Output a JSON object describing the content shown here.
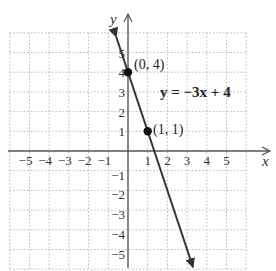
{
  "chart_data": {
    "type": "line",
    "title": "",
    "equation": "y = −3x + 4",
    "xlabel": "x",
    "ylabel": "y",
    "xlim": [
      -6,
      6
    ],
    "ylim": [
      -6,
      6
    ],
    "grid": true,
    "grid_style": "dotted",
    "x_tick_labels": [
      "−5",
      "−4",
      "−3",
      "−2",
      "−1",
      "1",
      "2",
      "3",
      "4",
      "5"
    ],
    "y_tick_labels": [
      "5",
      "4",
      "3",
      "2",
      "1",
      "−1",
      "−2",
      "−3",
      "−4",
      "−5"
    ],
    "series": [
      {
        "name": "y = −3x + 4",
        "slope": -3,
        "intercept": 4,
        "x": [
          -0.6,
          4.1
        ],
        "y": [
          5.8,
          -8.3
        ]
      }
    ],
    "points": [
      {
        "label": "(0, 4)",
        "x": 0,
        "y": 4
      },
      {
        "label": "(1, 1)",
        "x": 1,
        "y": 1
      }
    ]
  },
  "labels": {
    "x_axis": "x",
    "y_axis": "y",
    "equation": "y = −3x + 4",
    "point_a": "(0, 4)",
    "point_b": "(1, 1)"
  },
  "colors": {
    "axis": "#555555",
    "line": "#333333",
    "grid": "#b8b8b8",
    "point": "#111111"
  }
}
